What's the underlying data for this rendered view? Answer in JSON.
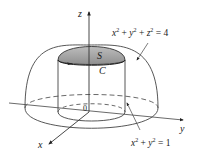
{
  "figure": {
    "axes": {
      "x_label": "x",
      "y_label": "y",
      "z_label": "z",
      "origin_label": "0"
    },
    "labels": {
      "surface": "S",
      "curve": "C",
      "sphere_eq_lhs_x": "x",
      "sphere_eq_lhs_y": "y",
      "sphere_eq_lhs_z": "z",
      "sphere_exp": "2",
      "sphere_eq_plus": "+",
      "sphere_eq_rhs": "= 4",
      "cylinder_eq_rhs": "= 1"
    },
    "equations": {
      "sphere": "x² + y² + z² = 4",
      "cylinder": "x² + y² = 1"
    },
    "colors": {
      "line": "#333333",
      "cap_fill": "#9e9e9e",
      "cap_fill_light": "#c4c4c4",
      "background": "#ffffff"
    }
  }
}
